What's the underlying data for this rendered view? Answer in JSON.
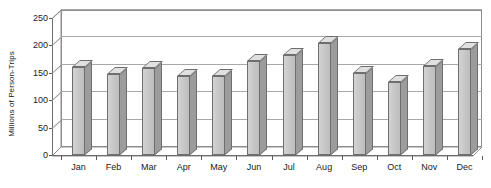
{
  "chart_data": {
    "type": "bar",
    "title": "",
    "subtitle": "",
    "xlabel": "",
    "ylabel": "Millions of Person-Trips",
    "categories": [
      "Jan",
      "Feb",
      "Mar",
      "Apr",
      "May",
      "Jun",
      "Jul",
      "Aug",
      "Sep",
      "Oct",
      "Nov",
      "Dec"
    ],
    "values": [
      160,
      148,
      158,
      145,
      145,
      172,
      182,
      205,
      150,
      133,
      162,
      193
    ],
    "ylim": [
      0,
      250
    ],
    "y_ticks": [
      0,
      50,
      100,
      150,
      200,
      250
    ],
    "y_tick_labels": [
      "0",
      "50",
      "100",
      "150",
      "200",
      "250"
    ],
    "grid": true,
    "grid_axis": "y",
    "legend": false,
    "legend_position": "none",
    "style": "3d-column",
    "annotations": []
  },
  "colors": {
    "bar_front": "#c8c8c8",
    "bar_side": "#9c9c9c",
    "bar_top": "#e0e0e0",
    "bar_outline": "#6e6e6e",
    "gridline": "#a8a8a8",
    "axis": "#6d6d6d",
    "text": "#1a1a1a",
    "background": "#ffffff"
  }
}
